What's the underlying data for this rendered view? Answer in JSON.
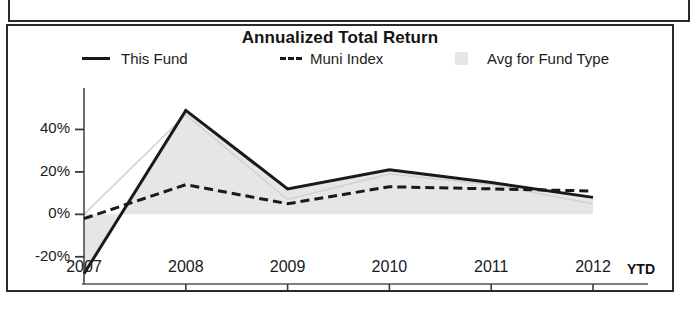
{
  "chart_panel": {
    "title": "Annualized Total Return",
    "legend": [
      {
        "label": "This Fund",
        "marker": "solid-line-swatch"
      },
      {
        "label": "Muni Index",
        "marker": "dashed-line-swatch"
      },
      {
        "label": "Avg for Fund Type",
        "marker": "gray-area-swatch"
      }
    ],
    "x_axis_suffix": "YTD"
  },
  "chart_data": {
    "type": "line",
    "title": "Annualized Total Return",
    "xlabel": "",
    "ylabel": "",
    "categories": [
      "2007",
      "2008",
      "2009",
      "2010",
      "2011",
      "2012"
    ],
    "x_tick_labels": [
      "2007",
      "2008",
      "2009",
      "2010",
      "2011",
      "2012"
    ],
    "y_tick_labels": [
      "40%",
      "20%",
      "0%",
      "-20%"
    ],
    "y_tick_values": [
      40,
      20,
      0,
      -20
    ],
    "ylim": [
      -30,
      52
    ],
    "grid": false,
    "legend_position": "top",
    "series": [
      {
        "name": "This Fund",
        "style": "solid",
        "color": "#1a1a1a",
        "values": [
          -28,
          49,
          12,
          21,
          15,
          8
        ]
      },
      {
        "name": "Muni Index",
        "style": "dashed",
        "color": "#1a1a1a",
        "values": [
          -2,
          14,
          5,
          13,
          12,
          11
        ]
      },
      {
        "name": "Avg for Fund Type",
        "style": "area",
        "color": "#e6e6e6",
        "values": [
          0,
          47,
          7,
          19,
          14,
          5
        ]
      }
    ]
  }
}
